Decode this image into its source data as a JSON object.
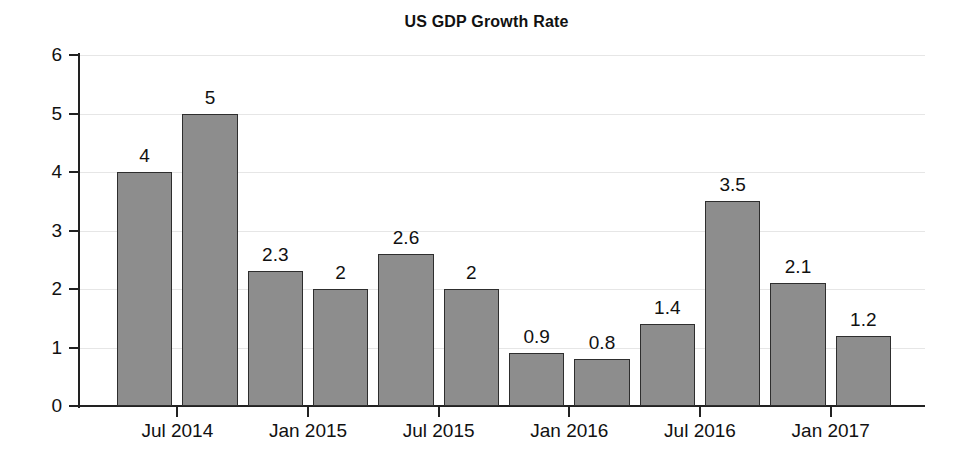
{
  "chart_data": {
    "type": "bar",
    "title": "US GDP Growth Rate",
    "xlabel": "",
    "ylabel": "",
    "ylim": [
      0,
      6
    ],
    "ytick_values": [
      0,
      1,
      2,
      3,
      4,
      5,
      6
    ],
    "ytick_labels": [
      "0",
      "1",
      "2",
      "3",
      "4",
      "5",
      "6"
    ],
    "xtick_labels": [
      "Jul 2014",
      "Jan 2015",
      "Jul 2015",
      "Jan 2016",
      "Jul 2016",
      "Jan 2017"
    ],
    "grid": true,
    "legend": false,
    "bar_labels_shown": true,
    "categories": [
      "Jul 2014 Q1",
      "Jul 2014 Q2",
      "Jan 2015 Q1",
      "Jan 2015 Q2",
      "Jul 2015 Q1",
      "Jul 2015 Q2",
      "Jan 2016 Q1",
      "Jan 2016 Q2",
      "Jul 2016 Q1",
      "Jul 2016 Q2",
      "Jan 2017 Q1",
      "Jan 2017 Q2"
    ],
    "values": [
      4,
      5,
      2.3,
      2,
      2.6,
      2,
      0.9,
      0.8,
      1.4,
      3.5,
      2.1,
      1.2
    ],
    "value_labels": [
      "4",
      "5",
      "2.3",
      "2",
      "2.6",
      "2",
      "0.9",
      "0.8",
      "1.4",
      "3.5",
      "2.1",
      "1.2"
    ],
    "colors": {
      "bar_fill": "#8d8d8d",
      "bar_edge": "#2e2e2e",
      "grid": "#e6e6e6",
      "axis": "#222222",
      "text": "#111111",
      "background": "#ffffff"
    }
  }
}
